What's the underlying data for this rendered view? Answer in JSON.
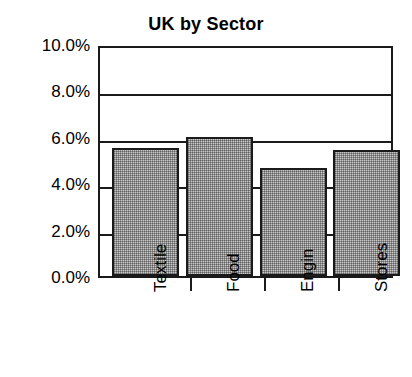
{
  "chart_data": {
    "type": "bar",
    "title": "UK by Sector",
    "xlabel": "",
    "ylabel": "",
    "categories": [
      "Textile",
      "Food",
      "Engin",
      "Stores"
    ],
    "values": [
      5.5,
      6.0,
      4.65,
      5.45
    ],
    "value_unit": "%",
    "ylim": [
      0.0,
      10.0
    ],
    "ytick_values": [
      0.0,
      2.0,
      4.0,
      6.0,
      8.0,
      10.0
    ],
    "ytick_labels": [
      "0.0%",
      "2.0%",
      "4.0%",
      "6.0%",
      "8.0%",
      "10.0%"
    ],
    "grid": true,
    "grid_axis": "y",
    "legend": false,
    "legend_position": "none",
    "series": [
      {
        "name": "UK by Sector",
        "values": [
          5.5,
          6.0,
          4.65,
          5.45
        ]
      }
    ],
    "colors": {
      "bar_fill": "#c9c9c9",
      "bar_outline": "#1a1a1a",
      "gridline": "#1a1a1a",
      "axis": "#1a1a1a",
      "text": "#000000",
      "background": "#ffffff"
    }
  }
}
